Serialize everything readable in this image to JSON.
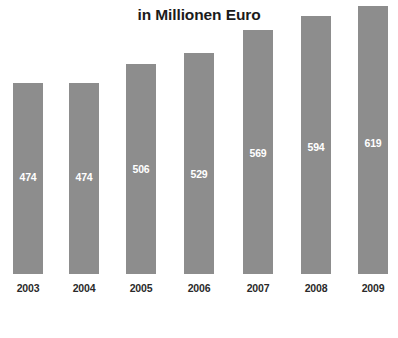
{
  "chart_data": {
    "type": "bar",
    "title": "in Millionen Euro",
    "xlabel": "",
    "ylabel": "",
    "categories": [
      "2003",
      "2004",
      "2005",
      "2006",
      "2007",
      "2008",
      "2009"
    ],
    "values": [
      474,
      474,
      506,
      529,
      569,
      594,
      619
    ],
    "value_labels": [
      "474",
      "474",
      "506",
      "529",
      "569",
      "594",
      "619"
    ],
    "series": [
      {
        "name": "in Millionen Euro",
        "values": [
          474,
          474,
          506,
          529,
          569,
          594,
          619
        ]
      }
    ],
    "ylim": [
      0,
      700
    ],
    "grid": false,
    "legend": false,
    "bar_color": "#8d8d8d",
    "value_label_color": "#ffffff",
    "tick_label_color": "#2a2a2a",
    "background": "#ffffff"
  },
  "bars": [
    {
      "category": "2003",
      "value": 474,
      "value_label": "474",
      "height_px": 191,
      "value_label_top_px": 88,
      "left_px": 13
    },
    {
      "category": "2004",
      "value": 474,
      "value_label": "474",
      "height_px": 191,
      "value_label_top_px": 88,
      "left_px": 69
    },
    {
      "category": "2005",
      "value": 506,
      "value_label": "506",
      "height_px": 210,
      "value_label_top_px": 99,
      "left_px": 126
    },
    {
      "category": "2006",
      "value": 529,
      "value_label": "529",
      "height_px": 221,
      "value_label_top_px": 115,
      "left_px": 184
    },
    {
      "category": "2007",
      "value": 569,
      "value_label": "569",
      "height_px": 244,
      "value_label_top_px": 117,
      "left_px": 243
    },
    {
      "category": "2008",
      "value": 594,
      "value_label": "594",
      "height_px": 258,
      "value_label_top_px": 125,
      "left_px": 301
    },
    {
      "category": "2009",
      "value": 619,
      "value_label": "619",
      "height_px": 268,
      "value_label_top_px": 131,
      "left_px": 358
    }
  ],
  "cropped_caption": " "
}
